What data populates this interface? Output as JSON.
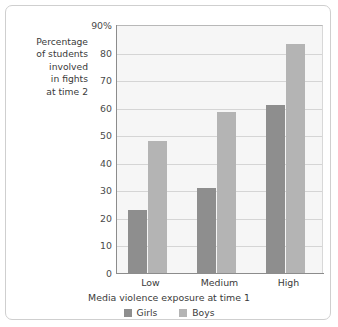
{
  "chart_data": {
    "type": "bar",
    "title": "",
    "xlabel": "Media violence exposure at time 1",
    "ylabel": "Percentage of students involved in fights at time 2",
    "ylabel_lines": [
      "Percentage",
      "of students",
      "involved",
      "in fights",
      "at time 2"
    ],
    "categories": [
      "Low",
      "Medium",
      "High"
    ],
    "series": [
      {
        "name": "Girls",
        "color": "#8e8e8e",
        "values": [
          23,
          31,
          61
        ]
      },
      {
        "name": "Boys",
        "color": "#b4b4b4",
        "values": [
          48,
          58.5,
          83
        ]
      }
    ],
    "ylim": [
      0,
      90
    ],
    "ytick_values": [
      0,
      10,
      20,
      30,
      40,
      50,
      60,
      70,
      80,
      90
    ],
    "ytick_labels": [
      "0",
      "10",
      "20",
      "30",
      "40",
      "50",
      "60",
      "70",
      "80",
      "90%"
    ],
    "grid": true,
    "grid_axis": "y",
    "legend_position": "bottom-center",
    "plot_background": "#f6f6f6"
  }
}
